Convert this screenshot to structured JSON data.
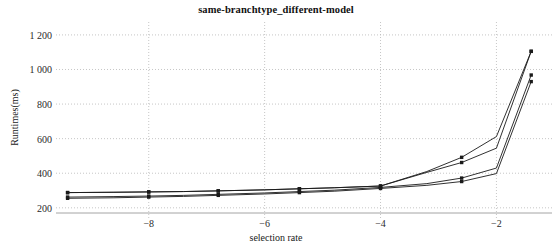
{
  "chart_data": {
    "type": "line",
    "title": "same-branchtype_different-model",
    "xlabel": "selection rate",
    "ylabel": "Runtimes(ms)",
    "xlim": [
      -9.6,
      -1.3
    ],
    "ylim": [
      170,
      1240
    ],
    "grid": true,
    "legend": "none",
    "x_ticks": [
      -8,
      -6,
      -4,
      -2
    ],
    "x_tick_labels": [
      "−8",
      "−6",
      "−4",
      "−2"
    ],
    "y_ticks": [
      200,
      400,
      600,
      800,
      1000,
      1200
    ],
    "y_tick_labels": [
      "200",
      "400",
      "600",
      "800",
      "1 000",
      "1 200"
    ],
    "x": [
      -9.4,
      -8.6,
      -8.0,
      -7.4,
      -6.8,
      -6.0,
      -5.4,
      -4.8,
      -4.0,
      -3.2,
      -2.6,
      -2.0,
      -1.4
    ],
    "series": [
      {
        "name": "series-1",
        "color": "#1a1a1a",
        "marker": "square",
        "values": [
          255,
          258,
          262,
          266,
          272,
          280,
          288,
          296,
          312,
          330,
          352,
          398,
          930
        ]
      },
      {
        "name": "series-2",
        "color": "#1a1a1a",
        "marker": "square",
        "values": [
          262,
          265,
          268,
          272,
          278,
          286,
          294,
          302,
          318,
          340,
          372,
          430,
          968
        ]
      },
      {
        "name": "series-3",
        "color": "#1a1a1a",
        "marker": "square",
        "values": [
          288,
          290,
          292,
          294,
          298,
          304,
          310,
          316,
          326,
          410,
          492,
          612,
          1105
        ]
      },
      {
        "name": "series-4",
        "color": "#1a1a1a",
        "marker": "square",
        "values": [
          288,
          290,
          292,
          294,
          298,
          304,
          310,
          316,
          326,
          405,
          462,
          545,
          1105
        ]
      }
    ]
  }
}
